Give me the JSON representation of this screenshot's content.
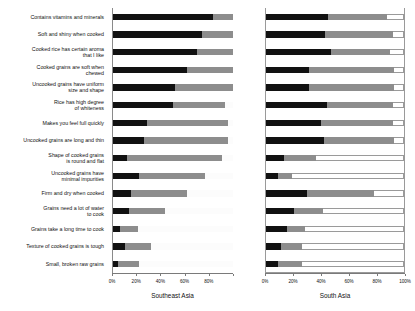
{
  "chart_data": {
    "type": "bar",
    "subtype": "100% stacked horizontal bar",
    "title": "",
    "xlabel": "",
    "ylabel": "",
    "xlim": [
      0,
      100
    ],
    "xticks": [
      0,
      20,
      40,
      60,
      80,
      100
    ],
    "xtick_labels": [
      "0%",
      "20%",
      "40%",
      "60%",
      "80%",
      "100%"
    ],
    "grid": false,
    "legend_position": "none",
    "categories": [
      "Contains vitamins and minerals",
      "Soft and shiny when cooked",
      "Cooked rice has certain aroma that I like",
      "Cooked grains are soft when chewed",
      "Uncooked grains have uniform size and shape",
      "Rice has high degree of whiteness",
      "Makes you feel full quickly",
      "Uncooked grains are long and thin",
      "Shape of cooked grains is round and flat",
      "Uncooked grains have minimal impurities",
      "Firm and dry when cooked",
      "Grains need a lot of water to cook",
      "Grains take a long time to cook",
      "Texture of cooked grains is tough",
      "Small, broken raw grains"
    ],
    "panels": [
      {
        "name": "Southeast Asia",
        "series": [
          {
            "name": "segment-dark",
            "color": "#111111",
            "values": [
              83,
              74,
              70,
              62,
              52,
              50,
              28,
              26,
              12,
              22,
              15,
              13,
              6,
              10,
              4
            ]
          },
          {
            "name": "segment-medium",
            "color": "#8d8d8d",
            "values": [
              17,
              26,
              30,
              38,
              48,
              43,
              68,
              70,
              79,
              55,
              47,
              30,
              15,
              22,
              18
            ]
          },
          {
            "name": "segment-light",
            "color": "#ffffff",
            "values": [
              0,
              0,
              0,
              0,
              0,
              7,
              4,
              4,
              9,
              23,
              38,
              57,
              79,
              68,
              78
            ]
          }
        ]
      },
      {
        "name": "South Asia",
        "series": [
          {
            "name": "segment-dark",
            "color": "#111111",
            "values": [
              45,
              43,
              47,
              31,
              31,
              44,
              40,
              42,
              13,
              9,
              30,
              20,
              15,
              11,
              9
            ]
          },
          {
            "name": "segment-medium",
            "color": "#8d8d8d",
            "values": [
              43,
              49,
              43,
              62,
              62,
              48,
              52,
              51,
              23,
              10,
              48,
              21,
              13,
              15,
              17
            ]
          },
          {
            "name": "segment-light",
            "color": "#ffffff",
            "values": [
              12,
              8,
              10,
              7,
              7,
              8,
              8,
              7,
              64,
              81,
              22,
              59,
              72,
              74,
              74
            ]
          }
        ]
      }
    ]
  },
  "labels": {
    "categories": [
      [
        "Contains vitamins and minerals"
      ],
      [
        "Soft and shiny when cooked"
      ],
      [
        "Cooked rice has certain aroma",
        "that I like"
      ],
      [
        "Cooked grains are soft when",
        "chewed"
      ],
      [
        "Uncooked grains have uniform",
        "size and shape"
      ],
      [
        "Rice has high degree",
        "of whiteness"
      ],
      [
        "Makes you feel full quickly"
      ],
      [
        "Uncooked grains are long and thin"
      ],
      [
        "Shape of cooked grains",
        "is round and flat"
      ],
      [
        "Uncooked grains have",
        "minimal impurities"
      ],
      [
        "Firm and dry when cooked"
      ],
      [
        "Grains need a lot of water",
        "to cook"
      ],
      [
        "Grains take a long time to cook"
      ],
      [
        "Texture of cooked grains is tough"
      ],
      [
        "Small, broken raw grains"
      ]
    ]
  },
  "panel_titles": {
    "southeast_asia": "Southeast Asia",
    "south_asia": "South Asia"
  }
}
